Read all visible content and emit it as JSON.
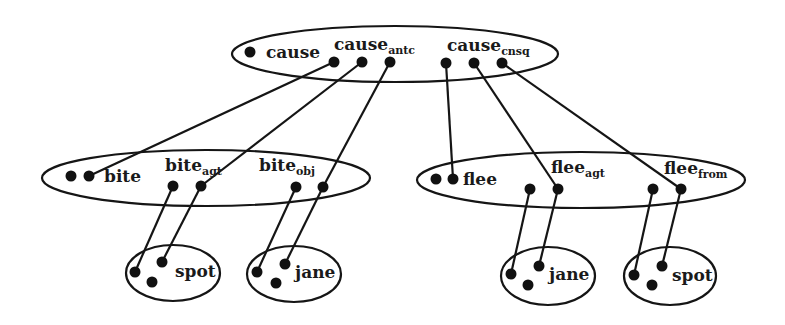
{
  "diagram": {
    "stroke_color": "#151515",
    "nodes": {
      "cause": {
        "label": "cause",
        "roles": [
          {
            "base": "cause",
            "sub": "antc"
          },
          {
            "base": "cause",
            "sub": "cnsq"
          }
        ]
      },
      "bite": {
        "label": "bite",
        "roles": [
          {
            "base": "bite",
            "sub": "agt"
          },
          {
            "base": "bite",
            "sub": "obj"
          }
        ]
      },
      "flee": {
        "label": "flee",
        "roles": [
          {
            "base": "flee",
            "sub": "agt"
          },
          {
            "base": "flee",
            "sub": "from"
          }
        ]
      },
      "spot_left": {
        "label": "spot"
      },
      "jane_left": {
        "label": "jane"
      },
      "jane_right": {
        "label": "jane"
      },
      "spot_right": {
        "label": "spot"
      }
    },
    "edges": [
      {
        "from": "cause_antc.1",
        "to": "bite"
      },
      {
        "from": "cause_antc.2",
        "to": "bite_agt.2"
      },
      {
        "from": "cause_antc.3",
        "to": "bite_obj.2"
      },
      {
        "from": "cause_cnsq.1",
        "to": "flee"
      },
      {
        "from": "cause_cnsq.2",
        "to": "flee_agt.2"
      },
      {
        "from": "cause_cnsq.3",
        "to": "flee_from.2"
      },
      {
        "from": "bite_agt.1",
        "to": "spot_left.1"
      },
      {
        "from": "bite_agt.2",
        "to": "spot_left.2"
      },
      {
        "from": "bite_obj.1",
        "to": "jane_left.1"
      },
      {
        "from": "bite_obj.2",
        "to": "jane_left.2"
      },
      {
        "from": "flee_agt.1",
        "to": "jane_right.1"
      },
      {
        "from": "flee_agt.2",
        "to": "jane_right.2"
      },
      {
        "from": "flee_from.1",
        "to": "spot_right.1"
      },
      {
        "from": "flee_from.2",
        "to": "spot_right.2"
      }
    ]
  }
}
